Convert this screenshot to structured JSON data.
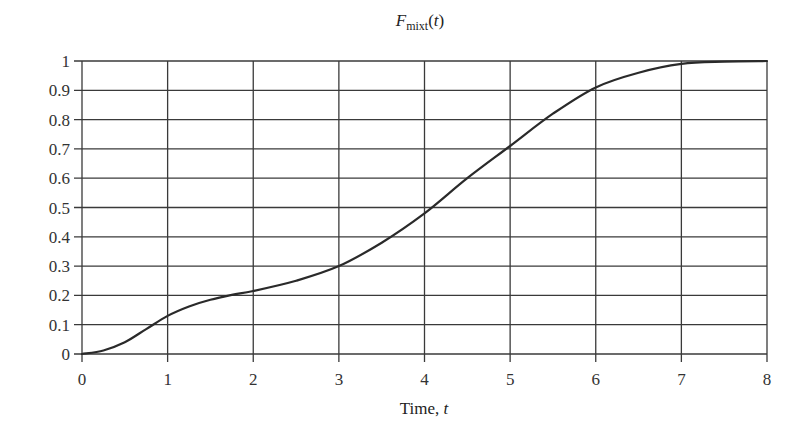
{
  "chart_data": {
    "type": "line",
    "title_parts": {
      "main": "F",
      "sub": "mixt",
      "arg": "(t)"
    },
    "xlabel": "Time, t",
    "xlabel_parts": {
      "text": "Time, ",
      "var": "t"
    },
    "ylabel": "",
    "xlim": [
      0,
      8
    ],
    "ylim": [
      0,
      1
    ],
    "x_ticks": [
      0,
      1,
      2,
      3,
      4,
      5,
      6,
      7,
      8
    ],
    "x_tick_labels": [
      "0",
      "1",
      "2",
      "3",
      "4",
      "5",
      "6",
      "7",
      "8"
    ],
    "y_ticks": [
      0,
      0.1,
      0.2,
      0.3,
      0.4,
      0.5,
      0.6,
      0.7,
      0.8,
      0.9,
      1
    ],
    "y_tick_labels": [
      "0",
      "0.1",
      "0.2",
      "0.3",
      "0.4",
      "0.5",
      "0.6",
      "0.7",
      "0.8",
      "0.9",
      "1"
    ],
    "grid": true,
    "legend": null,
    "series": [
      {
        "name": "F_mixt(t)",
        "x": [
          0,
          0.25,
          0.5,
          0.75,
          1,
          1.25,
          1.5,
          1.75,
          2,
          2.5,
          3,
          3.5,
          4,
          4.5,
          5,
          5.5,
          6,
          6.5,
          7,
          7.5,
          8
        ],
        "values": [
          0,
          0.012,
          0.04,
          0.085,
          0.13,
          0.162,
          0.185,
          0.202,
          0.215,
          0.25,
          0.3,
          0.38,
          0.48,
          0.6,
          0.71,
          0.82,
          0.91,
          0.96,
          0.99,
          0.998,
          1.0
        ]
      }
    ]
  },
  "colors": {
    "line": "#2a2a2a",
    "grid": "#3a3a3a",
    "text": "#333333",
    "background": "#ffffff"
  }
}
